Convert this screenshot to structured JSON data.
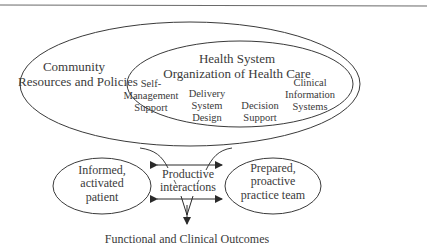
{
  "diagram": {
    "outer_region": {
      "label_line1": "Community",
      "label_line2": "Resources and Policies"
    },
    "inner_region": {
      "label_line1": "Health System",
      "label_line2": "Organization of Health Care",
      "components": [
        {
          "line1": "Self-",
          "line2": "Management",
          "line3": "Support"
        },
        {
          "line1": "Delivery",
          "line2": "System",
          "line3": "Design"
        },
        {
          "line1": "Decision",
          "line2": "Support"
        },
        {
          "line1": "Clinical",
          "line2": "Information",
          "line3": "Systems"
        }
      ]
    },
    "patient": {
      "line1": "Informed,",
      "line2": "activated",
      "line3": "patient"
    },
    "interactions": {
      "line1": "Productive",
      "line2": "interactions"
    },
    "team": {
      "line1": "Prepared,",
      "line2": "proactive",
      "line3": "practice team"
    },
    "outcome": "Functional and Clinical Outcomes",
    "colors": {
      "line": "#3a3a3a",
      "text": "#3a3a3a",
      "background": "#ffffff"
    }
  }
}
